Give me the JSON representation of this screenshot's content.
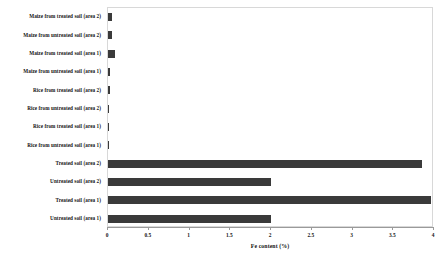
{
  "chart_data": {
    "type": "bar",
    "orientation": "horizontal",
    "title": "",
    "xlabel": "Fe content (%)",
    "ylabel": "",
    "xlim": [
      0,
      4
    ],
    "xticks": [
      "0",
      "0.5",
      "1",
      "1.5",
      "2",
      "2.5",
      "3",
      "3.5",
      "4"
    ],
    "xtick_values": [
      0,
      0.5,
      1,
      1.5,
      2,
      2.5,
      3,
      3.5,
      4
    ],
    "grid": false,
    "legend": false,
    "bar_color": "#3a3a3a",
    "categories": [
      "Maize from treated soil (area 2)",
      "Maize from untreated soil (area 2)",
      "Maize from treated soil (area 1)",
      "Maize from untreated soil (area 1)",
      "Rice from treated soil (area 2)",
      "Rice from untreated soil (area 2)",
      "Rice from treated soil (area 1)",
      "Rice from untreated soil (area 1)",
      "Treated soil (area 2)",
      "Untreated soil (area 2)",
      "Treated soil (area 1)",
      "Untreated soil (area 1)"
    ],
    "values": [
      0.05,
      0.05,
      0.085,
      0.025,
      0.025,
      0.012,
      0.01,
      0.01,
      3.85,
      2.0,
      3.96,
      2.0
    ]
  }
}
